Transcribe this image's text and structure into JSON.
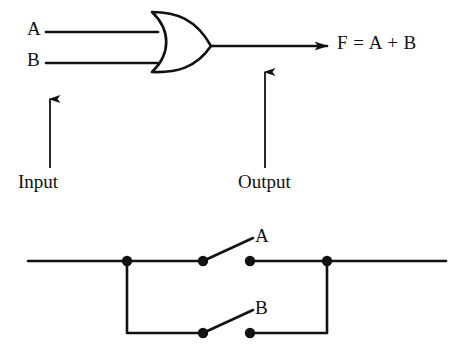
{
  "figure": {
    "background_color": "#ffffff",
    "ink_color": "#111111"
  },
  "gate_diagram": {
    "gate_type": "or-gate",
    "inputs": [
      {
        "label": "A"
      },
      {
        "label": "B"
      }
    ],
    "output": {
      "label": "F = A + B",
      "expression": "F=A+B"
    },
    "annotations": [
      {
        "label": "Input",
        "arrow": "up"
      },
      {
        "label": "Output",
        "arrow": "up"
      }
    ]
  },
  "switch_circuit": {
    "description": "Two switches connected in parallel",
    "switches": [
      {
        "label": "A",
        "state": "open",
        "branch": "top"
      },
      {
        "label": "B",
        "state": "open",
        "branch": "bottom"
      }
    ],
    "node_count": 8
  }
}
